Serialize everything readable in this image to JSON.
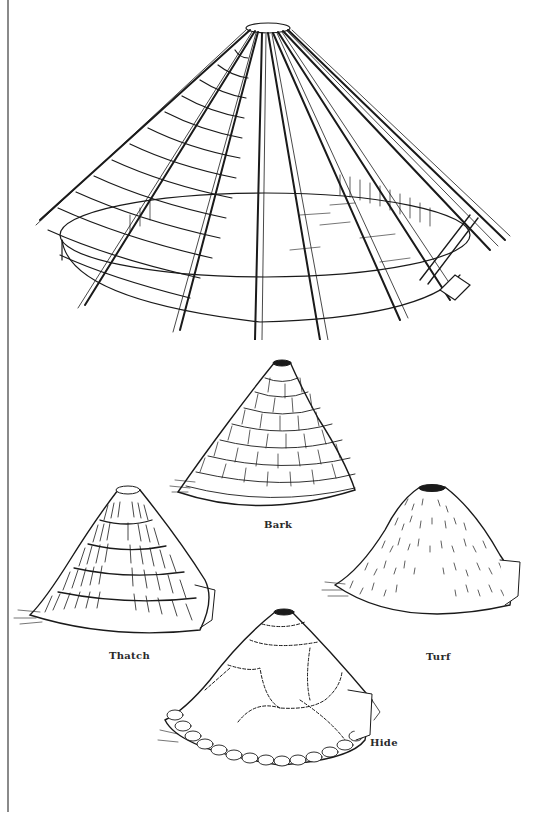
{
  "figure": {
    "frame": {
      "name": "roundhouse-frame"
    },
    "coverings": [
      {
        "id": "bark",
        "label": "Bark"
      },
      {
        "id": "thatch",
        "label": "Thatch"
      },
      {
        "id": "turf",
        "label": "Turf"
      },
      {
        "id": "hide",
        "label": "Hide"
      }
    ]
  },
  "colors": {
    "ink": "#1a1a1a",
    "paper": "#ffffff",
    "rule": "#8a8a8a"
  }
}
